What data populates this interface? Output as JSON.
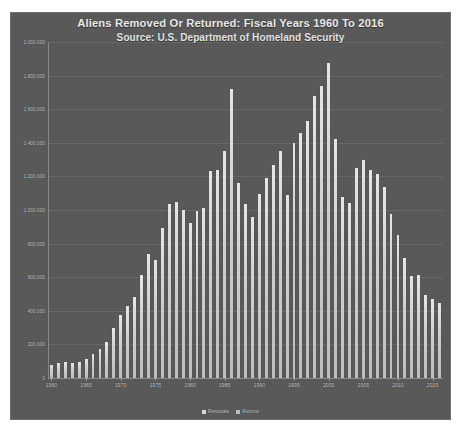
{
  "chart_data": {
    "type": "bar",
    "title": "Aliens Removed Or Returned: Fiscal Years 1960 To 2016",
    "subtitle": "Source: U.S. Department of Homeland Security",
    "xlabel": "",
    "ylabel": "",
    "grid": true,
    "legend_position": "bottom",
    "ylim": [
      0,
      2000000
    ],
    "ytick_labels": [
      "2,000,000",
      "1,800,000",
      "1,600,000",
      "1,400,000",
      "1,200,000",
      "1,000,000",
      "800,000",
      "600,000",
      "400,000",
      "200,000",
      "0"
    ],
    "ytick_values": [
      2000000,
      1800000,
      1600000,
      1400000,
      1200000,
      1000000,
      800000,
      600000,
      400000,
      200000,
      0
    ],
    "xtick_labels": [
      "1960",
      "1965",
      "1970",
      "1975",
      "1980",
      "1985",
      "1990",
      "1995",
      "2000",
      "2005",
      "2010",
      "2015"
    ],
    "legend": [
      {
        "name": "Removals",
        "color": "#d8d8d8"
      },
      {
        "name": "Returns",
        "color": "#bdbdbd"
      }
    ],
    "categories": [
      "1960",
      "1961",
      "1962",
      "1963",
      "1964",
      "1965",
      "1966",
      "1967",
      "1968",
      "1969",
      "1970",
      "1971",
      "1972",
      "1973",
      "1974",
      "1975",
      "1976",
      "1977",
      "1978",
      "1979",
      "1980",
      "1981",
      "1982",
      "1983",
      "1984",
      "1985",
      "1986",
      "1987",
      "1988",
      "1989",
      "1990",
      "1991",
      "1992",
      "1993",
      "1994",
      "1995",
      "1996",
      "1997",
      "1998",
      "1999",
      "2000",
      "2001",
      "2002",
      "2003",
      "2004",
      "2005",
      "2006",
      "2007",
      "2008",
      "2009",
      "2010",
      "2011",
      "2012",
      "2013",
      "2014",
      "2015",
      "2016"
    ],
    "values": [
      77000,
      90000,
      98000,
      92000,
      93000,
      115000,
      145000,
      175000,
      215000,
      295000,
      375000,
      430000,
      480000,
      615000,
      740000,
      705000,
      895000,
      1035000,
      1050000,
      1000000,
      920000,
      995000,
      1010000,
      1230000,
      1240000,
      1350000,
      1720000,
      1160000,
      1035000,
      960000,
      1095000,
      1190000,
      1265000,
      1350000,
      1090000,
      1400000,
      1460000,
      1530000,
      1680000,
      1740000,
      1875000,
      1425000,
      1075000,
      1040000,
      1250000,
      1295000,
      1240000,
      1215000,
      1135000,
      975000,
      850000,
      715000,
      605000,
      615000,
      495000,
      470000,
      445000
    ],
    "peak": {
      "year": "2000",
      "value": 1875000
    },
    "series": [
      {
        "name": "Removals",
        "values": [
          7000,
          8000,
          8000,
          8000,
          9000,
          10000,
          10000,
          10000,
          10000,
          11000,
          17000,
          18000,
          16000,
          17000,
          19000,
          24000,
          38000,
          32000,
          29000,
          26000,
          18000,
          17000,
          15000,
          19000,
          19000,
          24000,
          25000,
          25000,
          26000,
          34000,
          30000,
          33000,
          44000,
          43000,
          45000,
          51000,
          70000,
          114000,
          175000,
          183000,
          188000,
          189000,
          165000,
          211000,
          240000,
          246000,
          281000,
          319000,
          360000,
          395000,
          383000,
          387000,
          416000,
          434000,
          407000,
          333000,
          340000
        ]
      },
      {
        "name": "Returns",
        "values": [
          70000,
          82000,
          90000,
          84000,
          84000,
          105000,
          135000,
          165000,
          205000,
          284000,
          358000,
          412000,
          464000,
          598000,
          721000,
          681000,
          857000,
          1003000,
          1021000,
          974000,
          902000,
          978000,
          995000,
          1211000,
          1221000,
          1326000,
          1695000,
          1135000,
          1009000,
          926000,
          1065000,
          1157000,
          1221000,
          1307000,
          1045000,
          1349000,
          1390000,
          1416000,
          1505000,
          1557000,
          1687000,
          1236000,
          910000,
          829000,
          1010000,
          1049000,
          959000,
          896000,
          775000,
          580000,
          467000,
          328000,
          189000,
          181000,
          88000,
          137000,
          105000
        ]
      }
    ]
  }
}
